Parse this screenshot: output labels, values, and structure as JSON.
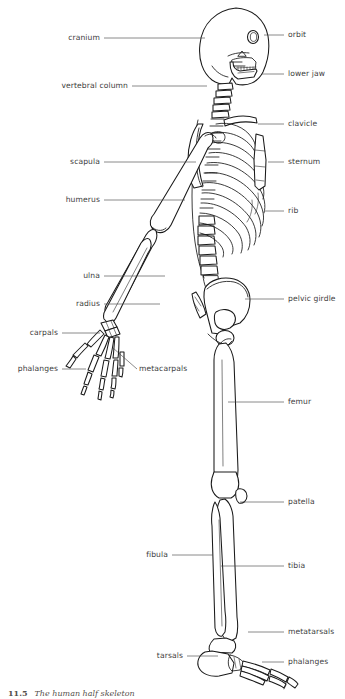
{
  "figure": {
    "title": "The human half skeleton",
    "view": "lateral (side) view of human skeleton",
    "style": "black-and-white line drawing",
    "caption_number": "11.5",
    "caption_text": "The human half skeleton",
    "colors": {
      "background": "#ffffff",
      "outline": "#1a1a1a",
      "label_text": "#3d3d3d",
      "leader_line": "#4a4a4a",
      "caption_text": "#55504c"
    }
  },
  "labels": {
    "left": [
      {
        "id": "cranium",
        "text": "cranium",
        "text_x": 100,
        "text_y": 38,
        "line": [
          [
            104,
            38
          ],
          [
            205,
            38
          ]
        ]
      },
      {
        "id": "vertebral-column",
        "text": "vertebral column",
        "text_x": 128,
        "text_y": 86,
        "line": [
          [
            132,
            86
          ],
          [
            207,
            86
          ]
        ]
      },
      {
        "id": "scapula",
        "text": "scapula",
        "text_x": 100,
        "text_y": 162,
        "line": [
          [
            104,
            162
          ],
          [
            196,
            162
          ]
        ]
      },
      {
        "id": "humerus",
        "text": "humerus",
        "text_x": 100,
        "text_y": 200,
        "line": [
          [
            104,
            200
          ],
          [
            185,
            200
          ]
        ]
      },
      {
        "id": "ulna",
        "text": "ulna",
        "text_x": 100,
        "text_y": 276,
        "line": [
          [
            104,
            276
          ],
          [
            165,
            276
          ]
        ]
      },
      {
        "id": "radius",
        "text": "radius",
        "text_x": 100,
        "text_y": 304,
        "line": [
          [
            104,
            304
          ],
          [
            160,
            304
          ]
        ]
      },
      {
        "id": "carpals",
        "text": "carpals",
        "text_x": 58,
        "text_y": 333,
        "line": [
          [
            62,
            333
          ],
          [
            100,
            333
          ]
        ]
      },
      {
        "id": "phalanges-hand",
        "text": "phalanges",
        "text_x": 58,
        "text_y": 369,
        "line": [
          [
            62,
            369
          ],
          [
            86,
            369
          ]
        ]
      },
      {
        "id": "fibula",
        "text": "fibula",
        "text_x": 168,
        "text_y": 555,
        "line": [
          [
            172,
            555
          ],
          [
            213,
            555
          ]
        ]
      },
      {
        "id": "tarsals",
        "text": "tarsals",
        "text_x": 183,
        "text_y": 656,
        "line": [
          [
            187,
            656
          ],
          [
            218,
            656
          ]
        ]
      }
    ],
    "right": [
      {
        "id": "orbit",
        "text": "orbit",
        "text_x": 288,
        "text_y": 35,
        "line": [
          [
            284,
            35
          ],
          [
            264,
            35
          ]
        ]
      },
      {
        "id": "lower-jaw",
        "text": "lower jaw",
        "text_x": 288,
        "text_y": 74,
        "line": [
          [
            284,
            74
          ],
          [
            262,
            74
          ]
        ]
      },
      {
        "id": "clavicle",
        "text": "clavicle",
        "text_x": 288,
        "text_y": 124,
        "line": [
          [
            284,
            124
          ],
          [
            258,
            124
          ]
        ]
      },
      {
        "id": "sternum",
        "text": "sternum",
        "text_x": 288,
        "text_y": 162,
        "line": [
          [
            284,
            162
          ],
          [
            268,
            162
          ]
        ]
      },
      {
        "id": "rib",
        "text": "rib",
        "text_x": 288,
        "text_y": 211,
        "line": [
          [
            284,
            211
          ],
          [
            265,
            211
          ]
        ]
      },
      {
        "id": "pelvic-girdle",
        "text": "pelvic girdle",
        "text_x": 288,
        "text_y": 299,
        "line": [
          [
            284,
            299
          ],
          [
            245,
            299
          ]
        ]
      },
      {
        "id": "femur",
        "text": "femur",
        "text_x": 288,
        "text_y": 402,
        "line": [
          [
            284,
            402
          ],
          [
            228,
            402
          ]
        ]
      },
      {
        "id": "patella",
        "text": "patella",
        "text_x": 288,
        "text_y": 502,
        "line": [
          [
            284,
            502
          ],
          [
            240,
            502
          ]
        ]
      },
      {
        "id": "tibia",
        "text": "tibia",
        "text_x": 288,
        "text_y": 566,
        "line": [
          [
            284,
            566
          ],
          [
            221,
            566
          ]
        ]
      },
      {
        "id": "metatarsals",
        "text": "metatarsals",
        "text_x": 288,
        "text_y": 632,
        "line": [
          [
            284,
            632
          ],
          [
            248,
            632
          ],
          [
            248,
            632
          ]
        ]
      },
      {
        "id": "phalanges-foot",
        "text": "phalanges",
        "text_x": 288,
        "text_y": 662,
        "line": [
          [
            284,
            662
          ],
          [
            262,
            662
          ]
        ]
      }
    ],
    "angled": [
      {
        "id": "metacarpals",
        "text": "metacarpals",
        "text_x": 139,
        "text_y": 369,
        "line": [
          [
            137,
            369
          ],
          [
            113,
            348
          ]
        ]
      }
    ]
  },
  "parts_list": [
    "cranium",
    "orbit",
    "lower jaw",
    "vertebral column",
    "clavicle",
    "scapula",
    "sternum",
    "humerus",
    "rib",
    "ulna",
    "radius",
    "pelvic girdle",
    "carpals",
    "metacarpals",
    "phalanges",
    "femur",
    "patella",
    "fibula",
    "tibia",
    "tarsals",
    "metatarsals"
  ]
}
